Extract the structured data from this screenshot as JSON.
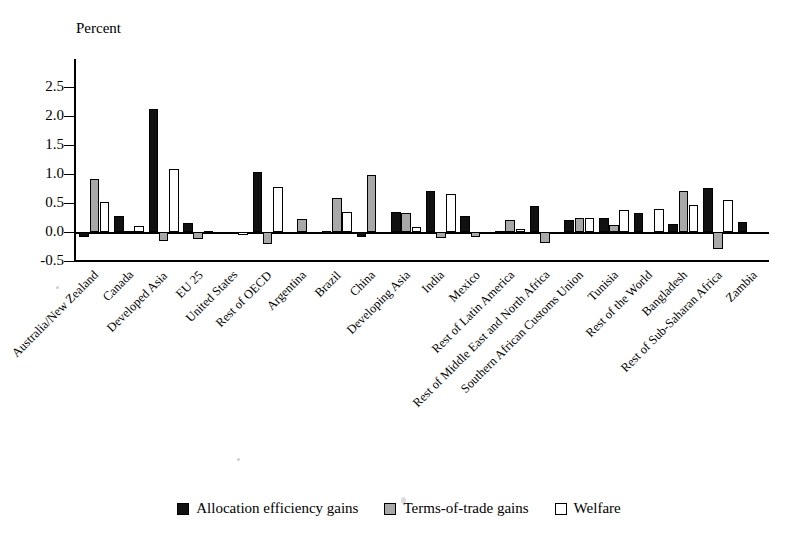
{
  "chart_data": {
    "type": "bar",
    "title": "",
    "ylabel": "Percent",
    "xlabel": "",
    "ylim": [
      -0.5,
      2.5
    ],
    "yticks": [
      "2.5",
      "2.0",
      "1.5",
      "1.0",
      "0.5",
      "0.0",
      "-0.5"
    ],
    "ytick_values": [
      2.5,
      2.0,
      1.5,
      1.0,
      0.5,
      0.0,
      -0.5
    ],
    "grid": false,
    "legend_position": "bottom",
    "categories": [
      "Australia/New Zealand",
      "Canada",
      "Developed Asia",
      "EU 25",
      "United States",
      "Rest of OECD",
      "Argentina",
      "Brazil",
      "China",
      "Developing Asia",
      "India",
      "Mexico",
      "Rest of Latin America",
      "Rest of Middle East and North Africa",
      "Southern African Customs Union",
      "Tunisia",
      "Rest of the World",
      "Bangladesh",
      "Rest of Sub-Saharan Africa",
      "Zambia"
    ],
    "series": [
      {
        "name": "Allocation efficiency gains",
        "color": "#111111",
        "values": [
          -0.09,
          0.27,
          2.12,
          0.16,
          -0.02,
          1.03,
          0.0,
          0.01,
          -0.08,
          0.35,
          0.7,
          0.27,
          0.02,
          0.44,
          0.2,
          0.25,
          0.32,
          0.14,
          0.76,
          0.17
        ]
      },
      {
        "name": "Terms-of-trade gains",
        "color": "#a8a8a8",
        "values": [
          0.92,
          0.02,
          -0.16,
          -0.12,
          -0.03,
          -0.21,
          0.22,
          0.58,
          0.99,
          0.33,
          -0.1,
          -0.09,
          0.2,
          -0.19,
          0.24,
          0.12,
          0.0,
          0.7,
          -0.3,
          0.0
        ]
      },
      {
        "name": "Welfare",
        "color": "#ffffff",
        "values": [
          0.51,
          0.11,
          1.09,
          0.02,
          -0.05,
          0.78,
          0.0,
          0.35,
          -0.03,
          0.08,
          0.66,
          0.0,
          0.06,
          0.0,
          0.25,
          0.38,
          0.4,
          0.46,
          0.55,
          0.0
        ]
      }
    ]
  },
  "legend": {
    "items": [
      {
        "label": "Allocation efficiency gains",
        "swatch": "black-square-icon"
      },
      {
        "label": "Terms-of-trade gains",
        "swatch": "gray-square-icon"
      },
      {
        "label": "Welfare",
        "swatch": "white-square-icon"
      }
    ]
  },
  "axis": {
    "y_title": "Percent"
  }
}
